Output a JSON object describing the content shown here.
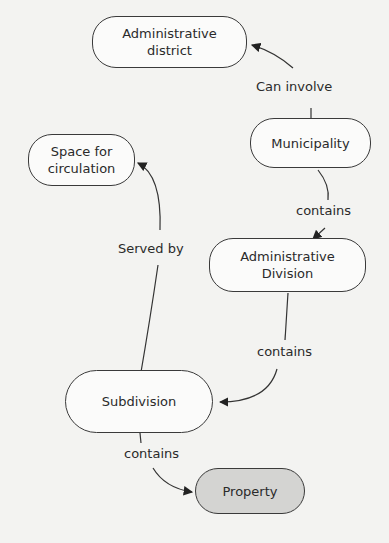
{
  "nodes": {
    "admin_district": "Administrative district",
    "municipality": "Municipality",
    "space_circulation": "Space for circulation",
    "admin_division": "Administrative Division",
    "subdivision": "Subdivision",
    "property": "Property"
  },
  "edges": {
    "can_involve": "Can involve",
    "contains_1": "contains",
    "served_by": "Served by",
    "contains_2": "contains",
    "contains_3": "contains"
  },
  "colors": {
    "highlight_node": "#d4d4d2",
    "node": "#fbfbfa",
    "stroke": "#3a3a3a"
  }
}
